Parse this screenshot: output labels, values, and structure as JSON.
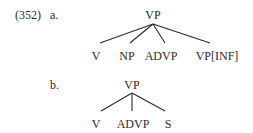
{
  "example": {
    "number": "(352)",
    "trees": [
      {
        "label": "a.",
        "root": "VP",
        "children": [
          "V",
          "NP",
          "ADVP",
          "VP[INF]"
        ]
      },
      {
        "label": "b.",
        "root": "VP",
        "children": [
          "V",
          "ADVP",
          "S"
        ]
      }
    ]
  }
}
